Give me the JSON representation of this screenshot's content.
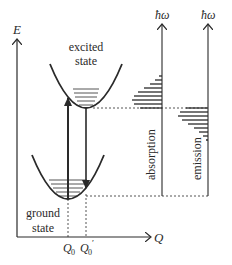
{
  "diagram": {
    "axes": {
      "energy_label": "E",
      "coordinate_label": "Q",
      "absorption_axis_label": "ħω",
      "emission_axis_label": "ħω"
    },
    "states": {
      "excited_line1": "excited",
      "excited_line2": "state",
      "ground_line1": "ground",
      "ground_line2": "state"
    },
    "positions": {
      "q0_label": "Q",
      "q0_sub": "0",
      "q0p_label": "Q",
      "q0p_sub": "0",
      "q0p_prime": "′"
    },
    "spectra": {
      "absorption_label": "absorption",
      "emission_label": "emission",
      "absorption_bar_lengths": [
        3,
        7,
        12,
        18,
        24,
        28,
        30,
        28,
        22
      ],
      "emission_bar_lengths": [
        22,
        28,
        30,
        26,
        20,
        14,
        9,
        5,
        2
      ]
    },
    "colors": {
      "line": "#2a2a2a",
      "background": "#ffffff"
    }
  }
}
